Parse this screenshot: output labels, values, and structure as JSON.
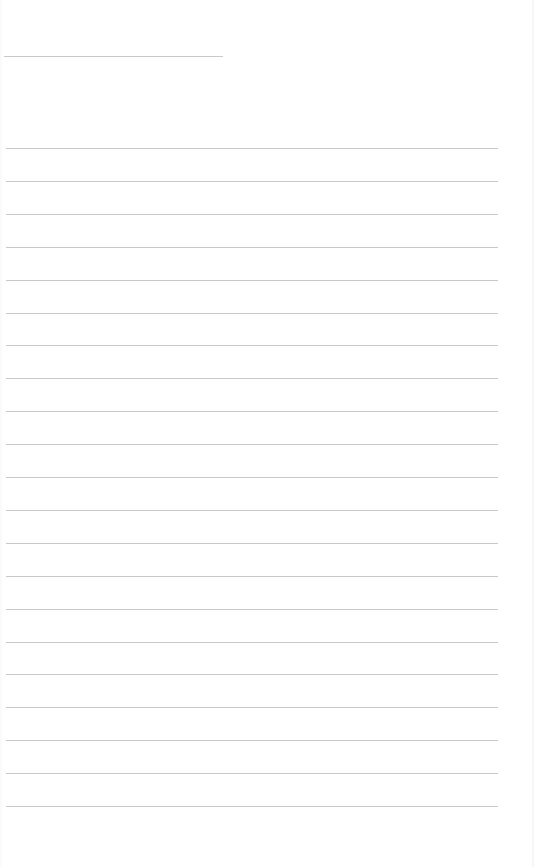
{
  "document": {
    "type": "lined-paper",
    "header_line": {
      "x": 4,
      "y": 56,
      "width": 219
    },
    "ruled_lines": {
      "count": 21,
      "first_y": 148,
      "spacing": 32.9,
      "x": 6,
      "width": 492
    },
    "line_color": "#c9c9c9",
    "background_color": "#ffffff",
    "text_content": []
  }
}
